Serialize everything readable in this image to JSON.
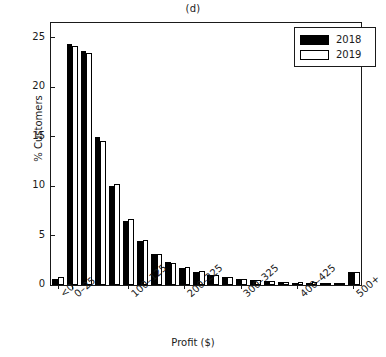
{
  "chart_data": {
    "type": "bar",
    "title": "(d)",
    "xlabel": "Profit ($)",
    "ylabel": "% Customers",
    "ylim": [
      0,
      26.5
    ],
    "yticks": [
      0,
      5,
      10,
      15,
      20,
      25
    ],
    "ytick_labels": [
      "0",
      "5",
      "10",
      "15",
      "20",
      "25"
    ],
    "grid": false,
    "legend_position": "top-right",
    "categories": [
      "<0",
      "0–25",
      "25–50",
      "50–75",
      "75–100",
      "100–125",
      "125–150",
      "150–175",
      "175–200",
      "200–225",
      "225–250",
      "250–275",
      "275–300",
      "300–325",
      "325–350",
      "350–375",
      "375–400",
      "400–425",
      "425–450",
      "450–475",
      "475–500",
      "500+"
    ],
    "labelled_ticks": [
      {
        "category": "<0",
        "label": "<0",
        "index": 0
      },
      {
        "category": "0–25",
        "label": "0–25",
        "index": 1
      },
      {
        "category": "100–125",
        "label": "100–125",
        "index": 5
      },
      {
        "category": "200–225",
        "label": "200–225",
        "index": 9
      },
      {
        "category": "300–325",
        "label": "300–325",
        "index": 13
      },
      {
        "category": "400–425",
        "label": "400–425",
        "index": 17
      },
      {
        "category": "500+",
        "label": "500+",
        "index": 21
      }
    ],
    "series": [
      {
        "name": "2018",
        "color": "#000000",
        "values": [
          0.6,
          24.4,
          23.7,
          15.0,
          10.0,
          6.5,
          4.5,
          3.1,
          2.3,
          1.7,
          1.3,
          1.0,
          0.8,
          0.6,
          0.5,
          0.4,
          0.3,
          0.25,
          0.25,
          0.2,
          0.15,
          1.3
        ]
      },
      {
        "name": "2019",
        "color": "#ffffff",
        "values": [
          0.8,
          24.2,
          23.5,
          14.6,
          10.2,
          6.7,
          4.6,
          3.1,
          2.2,
          1.8,
          1.4,
          1.05,
          0.8,
          0.6,
          0.5,
          0.4,
          0.35,
          0.3,
          0.3,
          0.25,
          0.2,
          1.3
        ]
      }
    ]
  },
  "legend": {
    "entries": [
      {
        "label": "2018",
        "style": "filled"
      },
      {
        "label": "2019",
        "style": "hollow"
      }
    ]
  }
}
